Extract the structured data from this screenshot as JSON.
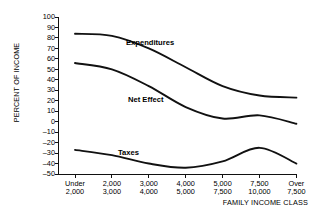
{
  "chart_data": {
    "type": "line",
    "title": "",
    "xlabel": "FAMILY INCOME CLASS",
    "ylabel": "PERCENT OF INCOME",
    "ylim": [
      -50,
      100
    ],
    "ytick_step": 10,
    "grid": false,
    "legend": "inline-labels",
    "yticks": [
      "100",
      "90",
      "80",
      "70",
      "60",
      "50",
      "40",
      "30",
      "20",
      "10",
      "0",
      "–10",
      "–20",
      "–30",
      "–40",
      "–50"
    ],
    "categories": [
      {
        "line1": "Under",
        "line2": "2,000"
      },
      {
        "line1": "2,000",
        "line2": "3,000"
      },
      {
        "line1": "3,000",
        "line2": "4,000"
      },
      {
        "line1": "4,000",
        "line2": "5,000"
      },
      {
        "line1": "5,000",
        "line2": "7,500"
      },
      {
        "line1": "7,500",
        "line2": "10,000"
      },
      {
        "line1": "Over",
        "line2": "7,500"
      }
    ],
    "series": [
      {
        "name": "Expenditures",
        "label": "Expenditures",
        "values": [
          84,
          82,
          70,
          52,
          34,
          25,
          23
        ]
      },
      {
        "name": "Net Effect",
        "label": "Net Effect",
        "values": [
          56,
          50,
          34,
          14,
          3,
          6,
          -2
        ]
      },
      {
        "name": "Taxes",
        "label": "Taxes",
        "values": [
          -27,
          -32,
          -40,
          -44,
          -38,
          -25,
          -40
        ]
      }
    ]
  },
  "axes": {
    "ylabel_text": "PERCENT OF INCOME",
    "xlabel_text": "FAMILY INCOME CLASS"
  },
  "colors": {
    "line": "#111111",
    "axis": "#111111",
    "background": "#ffffff"
  }
}
